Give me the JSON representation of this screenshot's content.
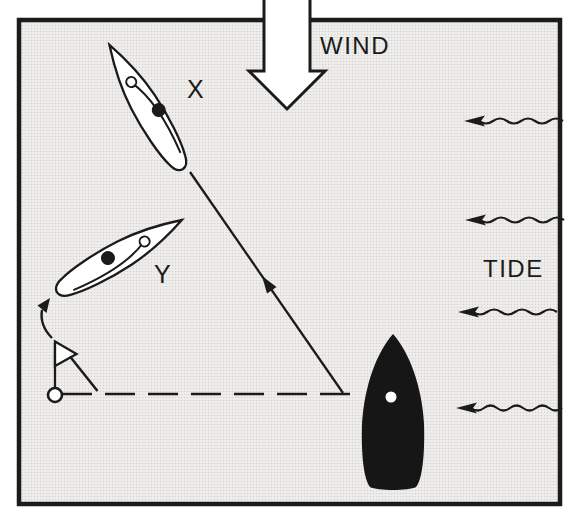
{
  "figure": {
    "type": "sailing-tactics-diagram",
    "labels": {
      "wind": "WIND",
      "tide": "TIDE",
      "boat_x": "X",
      "boat_y": "Y"
    },
    "colors": {
      "ink": "#1b1b1b",
      "paper": "#ffffff",
      "water_base": "#efeeec",
      "water_dot": "#d4d2ce",
      "boat_dark": "#161616",
      "hull_white": "#ffffff"
    },
    "wind": {
      "direction": "top-to-bottom",
      "arrow_style": "large-outline-block-arrow"
    },
    "tide": {
      "direction": "right-to-left",
      "arrow_count": 4,
      "arrow_style": "wavy-line-solid-head"
    },
    "boats": [
      {
        "label": "X",
        "hull": "white",
        "heading": "up-left",
        "crew_dot": "black",
        "mast_ring": "white"
      },
      {
        "label": "Y",
        "hull": "white",
        "heading": "up-right",
        "crew_dot": "black",
        "mast_ring": "white"
      },
      {
        "label": "",
        "hull": "black",
        "heading": "up",
        "deck_dot": "white"
      }
    ],
    "mark": {
      "type": "buoy",
      "flag": "triangular-pennant",
      "base": "open-circle"
    },
    "course": {
      "dashed_line": "horizontal rhumb line from mark to black boat",
      "solid_line": "diagonal track with arrowhead pointing up toward boat X",
      "rounding_arrow": "small curved arrow at mark pointing to stern of boat Y"
    }
  }
}
